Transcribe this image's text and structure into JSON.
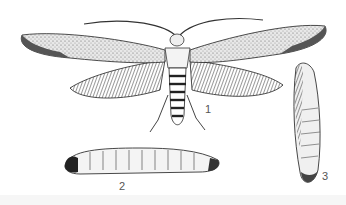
{
  "figure": {
    "labels": [
      {
        "id": "adult",
        "text": "1"
      },
      {
        "id": "larva",
        "text": "2"
      },
      {
        "id": "pupa",
        "text": "3"
      }
    ],
    "colors": {
      "ink": "#222222",
      "paper": "#ffffff",
      "label": "#555555"
    }
  }
}
